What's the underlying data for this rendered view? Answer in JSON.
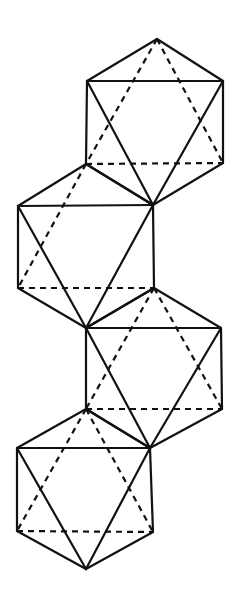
{
  "figure": {
    "line_color": "#111111",
    "background": "#ffffff",
    "vertices": {
      "a1": [
        157,
        39
      ],
      "a2": [
        87,
        81
      ],
      "a3": [
        223,
        81
      ],
      "a4": [
        86,
        164
      ],
      "a5": [
        223,
        163
      ],
      "a6": [
        153,
        205
      ],
      "b2": [
        18,
        206
      ],
      "b4": [
        18,
        288
      ],
      "b5": [
        154,
        288
      ],
      "b6": [
        86,
        328
      ],
      "c3": [
        221,
        328
      ],
      "c4": [
        86,
        409
      ],
      "c5": [
        222,
        409
      ],
      "c6": [
        150,
        448
      ],
      "d2": [
        17,
        448
      ],
      "d4": [
        17,
        531
      ],
      "d5": [
        153,
        532
      ],
      "d6": [
        86,
        569
      ]
    },
    "polyhedra": [
      {
        "name": "polyhedron-1",
        "solid": [
          [
            "a1",
            "a2"
          ],
          [
            "a1",
            "a3"
          ],
          [
            "a2",
            "a3"
          ],
          [
            "a2",
            "a4"
          ],
          [
            "a3",
            "a5"
          ],
          [
            "a2",
            "a6"
          ],
          [
            "a3",
            "a6"
          ],
          [
            "a4",
            "a6"
          ],
          [
            "a5",
            "a6"
          ]
        ],
        "dashed": [
          [
            "a1",
            "a4"
          ],
          [
            "a1",
            "a5"
          ],
          [
            "a4",
            "a5"
          ]
        ]
      },
      {
        "name": "polyhedron-2",
        "solid": [
          [
            "a4",
            "b2"
          ],
          [
            "a4",
            "a6"
          ],
          [
            "b2",
            "a6"
          ],
          [
            "b2",
            "b4"
          ],
          [
            "a6",
            "b5"
          ],
          [
            "b2",
            "b6"
          ],
          [
            "a6",
            "b6"
          ],
          [
            "b4",
            "b6"
          ],
          [
            "b5",
            "b6"
          ]
        ],
        "dashed": [
          [
            "a4",
            "b4"
          ],
          [
            "b4",
            "b5"
          ]
        ]
      },
      {
        "name": "polyhedron-3",
        "solid": [
          [
            "b5",
            "b6"
          ],
          [
            "b5",
            "c3"
          ],
          [
            "b6",
            "c3"
          ],
          [
            "b6",
            "c4"
          ],
          [
            "c3",
            "c5"
          ],
          [
            "b6",
            "c6"
          ],
          [
            "c3",
            "c6"
          ],
          [
            "c4",
            "c6"
          ],
          [
            "c5",
            "c6"
          ]
        ],
        "dashed": [
          [
            "b5",
            "c4"
          ],
          [
            "b5",
            "c5"
          ],
          [
            "c4",
            "c5"
          ]
        ]
      },
      {
        "name": "polyhedron-4",
        "solid": [
          [
            "c4",
            "d2"
          ],
          [
            "c4",
            "c6"
          ],
          [
            "d2",
            "c6"
          ],
          [
            "d2",
            "d4"
          ],
          [
            "c6",
            "d5"
          ],
          [
            "d2",
            "d6"
          ],
          [
            "c6",
            "d6"
          ],
          [
            "d4",
            "d6"
          ],
          [
            "d5",
            "d6"
          ]
        ],
        "dashed": [
          [
            "c4",
            "d4"
          ],
          [
            "c4",
            "d5"
          ],
          [
            "d4",
            "d5"
          ]
        ]
      }
    ]
  }
}
